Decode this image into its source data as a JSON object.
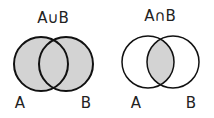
{
  "diagrams": [
    {
      "title": "A∪B",
      "set_a_label": "A",
      "set_b_label": "B",
      "shaded_region": "union"
    },
    {
      "title": "A∩B",
      "set_a_label": "A",
      "set_b_label": "B",
      "shaded_region": "intersection"
    }
  ],
  "colors": {
    "shade": "#d3d3d3",
    "stroke": "#111111",
    "background": "#ffffff"
  }
}
